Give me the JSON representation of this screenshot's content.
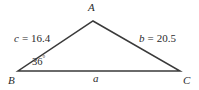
{
  "figure": {
    "type": "geometry-diagram",
    "shape": "triangle",
    "background_color": "#ffffff",
    "stroke_color": "#3a3a3a",
    "text_color": "#2b2b2b"
  },
  "vertices": {
    "a": {
      "label": "A",
      "x": 93,
      "y": 21
    },
    "b": {
      "label": "B",
      "x": 18,
      "y": 71
    },
    "c": {
      "label": "C",
      "x": 180,
      "y": 71
    }
  },
  "sides": {
    "c": {
      "variable": "c",
      "equals": "=",
      "value": "16.4",
      "full_text": "c = 16.4",
      "between": "B-A"
    },
    "b": {
      "variable": "b",
      "equals": "=",
      "value": "20.5",
      "full_text": "b = 20.5",
      "between": "A-C"
    },
    "a": {
      "variable": "a",
      "equals": "",
      "value": "",
      "full_text": "a",
      "between": "B-C"
    }
  },
  "angles": {
    "b": {
      "value": "36",
      "degree_symbol": "°",
      "full_text": "36°",
      "at_vertex": "B"
    }
  }
}
